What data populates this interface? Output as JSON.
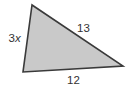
{
  "figure": {
    "shape": "triangle",
    "fill_color": "#c9c9c9",
    "stroke_color": "#3a3a3a",
    "sides": {
      "left": {
        "coefficient": "3",
        "variable": "x"
      },
      "hypotenuse": {
        "label": "13"
      },
      "bottom": {
        "label": "12"
      }
    }
  }
}
